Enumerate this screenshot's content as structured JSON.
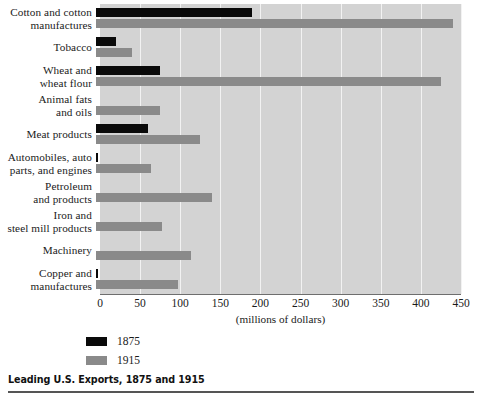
{
  "caption": "Leading U.S. Exports, 1875 and 1915",
  "axis_title": "(millions of dollars)",
  "legend": [
    {
      "label": "1875",
      "color": "#0a0a0a"
    },
    {
      "label": "1915",
      "color": "#8a8a8a"
    }
  ],
  "colors": {
    "series_1875": "#0a0a0a",
    "series_1915": "#8a8a8a",
    "plot_background": "#d3d3d3",
    "gridline": "#f2f2f2",
    "axis": "#6e6e6e",
    "text": "#1a1a1a"
  },
  "chart_data": {
    "type": "bar",
    "orientation": "horizontal",
    "title": "Leading U.S. Exports, 1875 and 1915",
    "xlabel": "(millions of dollars)",
    "ylabel": "",
    "xlim": [
      0,
      450
    ],
    "xticks": [
      0,
      50,
      100,
      150,
      200,
      250,
      300,
      350,
      400,
      450
    ],
    "grid": true,
    "legend_position": "below-left",
    "categories": [
      "Cotton and cotton manufactures",
      "Tobacco",
      "Wheat and wheat flour",
      "Animal fats and oils",
      "Meat products",
      "Automobiles, auto parts, and engines",
      "Petroleum and products",
      "Iron and steel mill products",
      "Machinery",
      "Copper and manufactures"
    ],
    "category_lines": [
      [
        "Cotton and cotton",
        "manufactures"
      ],
      [
        "Tobacco",
        ""
      ],
      [
        "Wheat and",
        "wheat flour"
      ],
      [
        "Animal fats",
        "and oils"
      ],
      [
        "Meat products",
        ""
      ],
      [
        "Automobiles, auto",
        "parts, and engines"
      ],
      [
        "Petroleum",
        "and products"
      ],
      [
        "Iron and",
        "steel mill products"
      ],
      [
        "Machinery",
        ""
      ],
      [
        "Copper and",
        "manufactures"
      ]
    ],
    "series": [
      {
        "name": "1875",
        "color": "#0a0a0a",
        "values": [
          195,
          25,
          80,
          0,
          65,
          2,
          0,
          0,
          0,
          3
        ]
      },
      {
        "name": "1915",
        "color": "#8a8a8a",
        "values": [
          445,
          45,
          430,
          80,
          130,
          68,
          145,
          82,
          118,
          102
        ]
      }
    ]
  }
}
